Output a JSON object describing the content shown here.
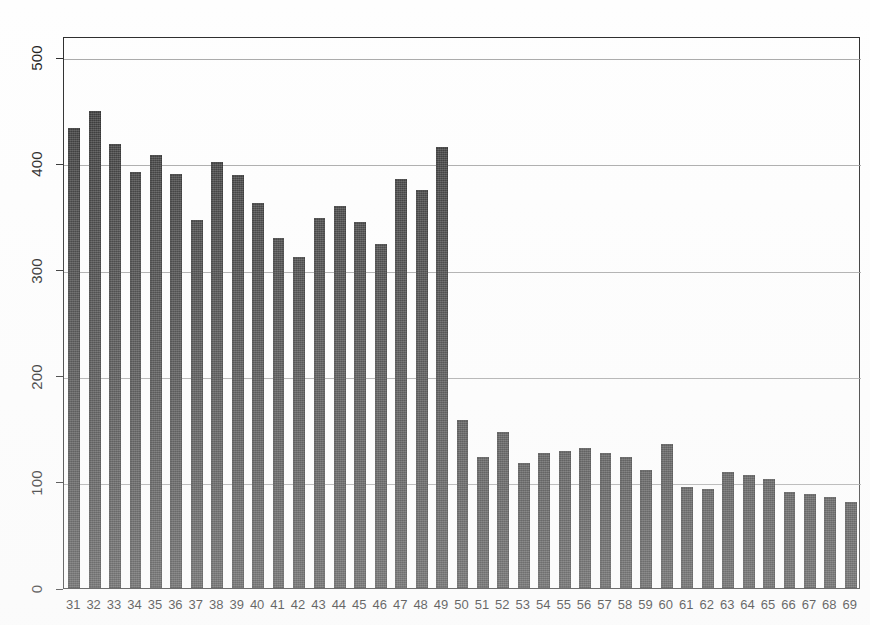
{
  "chart_data": {
    "type": "bar",
    "title": "",
    "subtitle": "",
    "xlabel": "",
    "ylabel": "",
    "xlim": [
      30.5,
      69.5
    ],
    "ylim": [
      0,
      520
    ],
    "grid": true,
    "legend": false,
    "legend_position": "none",
    "bar_color": "#3b3b3b",
    "background_color": "#ffffff",
    "axis_color": "#2b2b2b",
    "gridline_color": "#9a9a9a",
    "y_ticks": [
      0,
      100,
      200,
      300,
      400,
      500
    ],
    "y_tick_labels": [
      "0",
      "100",
      "200",
      "300",
      "400",
      "500"
    ],
    "y_tick_label_rotation": 90,
    "categories": [
      "31",
      "32",
      "33",
      "34",
      "35",
      "36",
      "37",
      "38",
      "39",
      "40",
      "41",
      "42",
      "43",
      "44",
      "45",
      "46",
      "47",
      "48",
      "49",
      "50",
      "51",
      "52",
      "53",
      "54",
      "55",
      "56",
      "57",
      "58",
      "59",
      "60",
      "61",
      "62",
      "63",
      "64",
      "65",
      "66",
      "67",
      "68",
      "69"
    ],
    "values": [
      433,
      449,
      418,
      392,
      408,
      390,
      347,
      401,
      389,
      363,
      330,
      312,
      349,
      360,
      345,
      324,
      385,
      375,
      415,
      158,
      123,
      147,
      118,
      127,
      129,
      132,
      127,
      123,
      111,
      136,
      95,
      93,
      109,
      106,
      103,
      90,
      89,
      86,
      81
    ]
  },
  "figure": {
    "plot_left": 63,
    "plot_top": 37,
    "plot_right": 860,
    "plot_bottom": 589
  }
}
